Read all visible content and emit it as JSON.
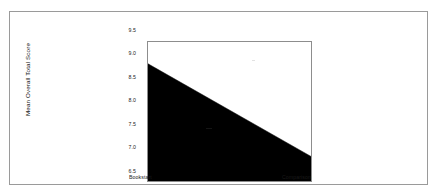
{
  "figure": {
    "background_color": "#ffffff",
    "frame_color": "#9a9a9a",
    "plot_frame_color": "#8d8d8d"
  },
  "chart_data": {
    "type": "area",
    "title": "",
    "subtitle": "",
    "xlabel": "",
    "ylabel": "Mean Overall Total Score",
    "categories": [
      "Bookstart",
      "Comparison"
    ],
    "values": [
      9.03,
      7.03
    ],
    "series": [
      {
        "name": "Mean Overall Total Score",
        "values": [
          9.03,
          7.03
        ],
        "color": "#000000",
        "fill": "solid-black",
        "fill_baseline": 6.5
      }
    ],
    "ylim": [
      6.5,
      9.5
    ],
    "yticks": [
      6.5,
      7.0,
      7.5,
      8.0,
      8.5,
      9.0,
      9.5
    ],
    "ytick_labels": [
      "6.5",
      "7.0",
      "7.5",
      "8.0",
      "8.5",
      "9.0",
      "9.5"
    ],
    "xtick_labels": [
      "Bookstart",
      "Comparison"
    ],
    "grid": false,
    "legend": false,
    "legend_position": "none",
    "annotations": []
  }
}
